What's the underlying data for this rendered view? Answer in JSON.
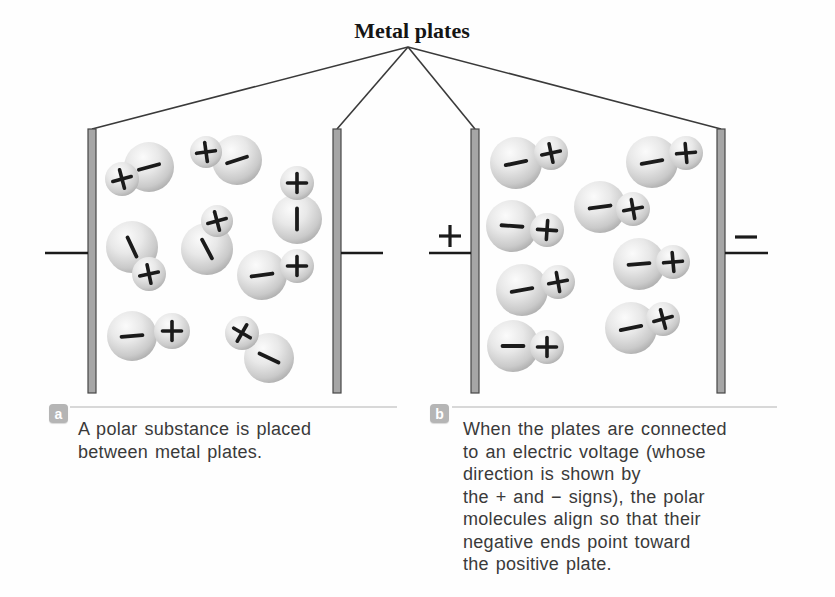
{
  "title": "Metal plates",
  "colors": {
    "sphere_highlight": "#fbfbfb",
    "sphere_mid": "#dedede",
    "sphere_edge": "#a2a2a2",
    "plate_fill": "#a6a6a6",
    "plate_border": "#474747",
    "sign_color": "#1b1b1b",
    "pointer_line": "#3a3a3a",
    "wire": "#1b1b1b",
    "divider": "#d8d8d8",
    "badge_bg": "#b5b5b5",
    "caption_text": "#3a3a3a"
  },
  "diagram": {
    "apex": {
      "x": 408,
      "y": 47
    },
    "pointer_targets": [
      {
        "x": 92,
        "y": 129
      },
      {
        "x": 337,
        "y": 129
      },
      {
        "x": 475,
        "y": 129
      },
      {
        "x": 721,
        "y": 129
      }
    ],
    "plates": [
      {
        "name": "panel-a-left-plate",
        "x": 88,
        "y": 129,
        "w": 8,
        "h": 264
      },
      {
        "name": "panel-a-right-plate",
        "x": 333,
        "y": 129,
        "w": 8,
        "h": 264
      },
      {
        "name": "panel-b-left-plate",
        "x": 471,
        "y": 129,
        "w": 8,
        "h": 264
      },
      {
        "name": "panel-b-right-plate",
        "x": 717,
        "y": 129,
        "w": 8,
        "h": 264
      }
    ],
    "wires": [
      {
        "x1": 45,
        "x2": 88,
        "y": 253
      },
      {
        "x1": 341,
        "x2": 383,
        "y": 253
      },
      {
        "x1": 429,
        "x2": 471,
        "y": 253
      },
      {
        "x1": 725,
        "x2": 768,
        "y": 253
      }
    ],
    "terminals": [
      {
        "sign": "plus",
        "label": "+",
        "x": 450,
        "y": 236
      },
      {
        "sign": "minus",
        "label": "−",
        "x": 746,
        "y": 237
      }
    ],
    "molecules": {
      "panel_a": [
        {
          "lx": 149,
          "ly": 167,
          "lr": 25,
          "la": -15,
          "sx": 122,
          "sy": 179,
          "sr": 17,
          "sa": -15
        },
        {
          "lx": 237,
          "ly": 160,
          "lr": 25,
          "la": -18,
          "sx": 206,
          "sy": 152,
          "sr": 16,
          "sa": -8
        },
        {
          "lx": 297,
          "ly": 219,
          "lr": 25,
          "la": 90,
          "sx": 297,
          "sy": 183,
          "sr": 17,
          "sa": 0
        },
        {
          "lx": 132,
          "ly": 247,
          "lr": 26,
          "la": 65,
          "sx": 149,
          "sy": 274,
          "sr": 17,
          "sa": -12
        },
        {
          "lx": 207,
          "ly": 249,
          "lr": 26,
          "la": 62,
          "sx": 217,
          "sy": 221,
          "sr": 16,
          "sa": -15
        },
        {
          "lx": 262,
          "ly": 275,
          "lr": 25,
          "la": -8,
          "sx": 297,
          "sy": 266,
          "sr": 17,
          "sa": 0
        },
        {
          "lx": 132,
          "ly": 336,
          "lr": 25,
          "la": -5,
          "sx": 172,
          "sy": 331,
          "sr": 18,
          "sa": 0
        },
        {
          "lx": 269,
          "ly": 358,
          "lr": 25,
          "la": 25,
          "sx": 242,
          "sy": 333,
          "sr": 17,
          "sa": 30
        }
      ],
      "panel_b": [
        {
          "lx": 516,
          "ly": 163,
          "lr": 26,
          "la": -12,
          "sx": 551,
          "sy": 153,
          "sr": 17,
          "sa": -12
        },
        {
          "lx": 652,
          "ly": 162,
          "lr": 26,
          "la": -10,
          "sx": 686,
          "sy": 153,
          "sr": 17,
          "sa": -5
        },
        {
          "lx": 600,
          "ly": 207,
          "lr": 26,
          "la": -8,
          "sx": 633,
          "sy": 209,
          "sr": 17,
          "sa": -10
        },
        {
          "lx": 512,
          "ly": 226,
          "lr": 26,
          "la": 4,
          "sx": 547,
          "sy": 230,
          "sr": 17,
          "sa": 4
        },
        {
          "lx": 639,
          "ly": 264,
          "lr": 26,
          "la": -5,
          "sx": 673,
          "sy": 262,
          "sr": 17,
          "sa": -5
        },
        {
          "lx": 522,
          "ly": 290,
          "lr": 26,
          "la": -10,
          "sx": 558,
          "sy": 282,
          "sr": 17,
          "sa": -10
        },
        {
          "lx": 631,
          "ly": 328,
          "lr": 26,
          "la": -12,
          "sx": 663,
          "sy": 319,
          "sr": 17,
          "sa": -15
        },
        {
          "lx": 513,
          "ly": 346,
          "lr": 26,
          "la": 0,
          "sx": 547,
          "sy": 347,
          "sr": 17,
          "sa": 0
        }
      ]
    }
  },
  "captions": {
    "a": {
      "badge": "a",
      "lines": [
        "A polar substance is placed",
        "between metal plates."
      ]
    },
    "b": {
      "badge": "b",
      "lines": [
        "When the plates are connected",
        "to an electric voltage (whose",
        "direction is shown by",
        "the + and − signs), the polar",
        "molecules align so that their",
        "negative ends point toward",
        "the positive plate."
      ]
    }
  }
}
